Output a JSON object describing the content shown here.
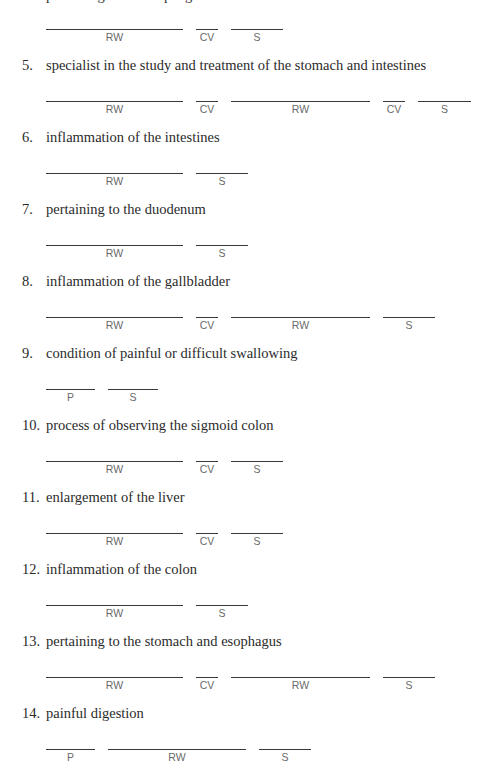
{
  "clipped_previous_item": "pertaining to the esophagus",
  "items": [
    {
      "number": "",
      "text": "",
      "blanks": [
        "RW",
        "CV",
        "S"
      ]
    },
    {
      "number": "5.",
      "text": "specialist in the study and treatment of the stomach and intestines",
      "blanks": [
        "RW",
        "CV",
        "RW",
        "CV",
        "S"
      ]
    },
    {
      "number": "6.",
      "text": "inflammation of the intestines",
      "blanks": [
        "RW",
        "S"
      ]
    },
    {
      "number": "7.",
      "text": "pertaining to the duodenum",
      "blanks": [
        "RW",
        "S"
      ]
    },
    {
      "number": "8.",
      "text": "inflammation of the gallbladder",
      "blanks": [
        "RW",
        "CV",
        "RW",
        "S"
      ]
    },
    {
      "number": "9.",
      "text": "condition of painful or difficult swallowing",
      "blanks": [
        "P",
        "S"
      ]
    },
    {
      "number": "10.",
      "text": "process of observing the sigmoid colon",
      "blanks": [
        "RW",
        "CV",
        "S"
      ]
    },
    {
      "number": "11.",
      "text": "enlargement of the liver",
      "blanks": [
        "RW",
        "CV",
        "S"
      ]
    },
    {
      "number": "12.",
      "text": "inflammation of the colon",
      "blanks": [
        "RW",
        "S"
      ]
    },
    {
      "number": "13.",
      "text": "pertaining to the stomach and esophagus",
      "blanks": [
        "RW",
        "CV",
        "RW",
        "S"
      ]
    },
    {
      "number": "14.",
      "text": "painful digestion",
      "blanks": [
        "P",
        "RW",
        "S"
      ]
    }
  ]
}
